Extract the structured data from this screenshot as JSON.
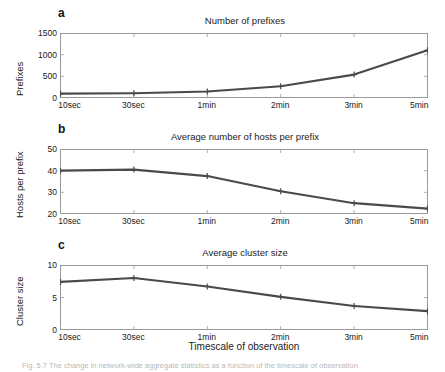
{
  "figure": {
    "xaxis_title": "Timescale of observation",
    "caption": "Fig. 5.7  The change in network-wide aggregate statistics as a function of the timescale of observation",
    "line_color": "#4a4a4a",
    "frame_color": "#9a9a9a"
  },
  "chart_data": [
    {
      "type": "line",
      "panel": "a",
      "title": "Number of prefixes",
      "xlabel": "Timescale of observation",
      "ylabel": "Prefixes",
      "categories": [
        "10sec",
        "30sec",
        "1min",
        "2min",
        "3min",
        "5min"
      ],
      "values": [
        100,
        110,
        150,
        270,
        540,
        1100
      ],
      "ylim": [
        0,
        1500
      ],
      "yticks": [
        0,
        500,
        1000,
        1500
      ],
      "ytick_labels": [
        "0",
        "500",
        "1000",
        "1500"
      ],
      "grid": false,
      "legend": "none",
      "marker": "plus"
    },
    {
      "type": "line",
      "panel": "b",
      "title": "Average number of hosts per prefix",
      "xlabel": "Timescale of observation",
      "ylabel": "Hosts per prefix",
      "categories": [
        "10sec",
        "30sec",
        "1min",
        "2min",
        "3min",
        "5min"
      ],
      "values": [
        40.0,
        40.5,
        37.5,
        30.5,
        25.0,
        22.5
      ],
      "ylim": [
        20,
        50
      ],
      "yticks": [
        20,
        30,
        40,
        50
      ],
      "ytick_labels": [
        "20",
        "30",
        "40",
        "50"
      ],
      "grid": false,
      "legend": "none",
      "marker": "plus"
    },
    {
      "type": "line",
      "panel": "c",
      "title": "Average cluster size",
      "xlabel": "Timescale of observation",
      "ylabel": "Cluster size",
      "categories": [
        "10sec",
        "30sec",
        "1min",
        "2min",
        "3min",
        "5min"
      ],
      "values": [
        7.4,
        8.0,
        6.7,
        5.1,
        3.7,
        2.9
      ],
      "ylim": [
        0,
        10
      ],
      "yticks": [
        0,
        5,
        10
      ],
      "ytick_labels": [
        "0",
        "5",
        "10"
      ],
      "grid": false,
      "legend": "none",
      "marker": "plus"
    }
  ],
  "panels": {
    "a": {
      "letter": "a"
    },
    "b": {
      "letter": "b"
    },
    "c": {
      "letter": "c"
    }
  }
}
